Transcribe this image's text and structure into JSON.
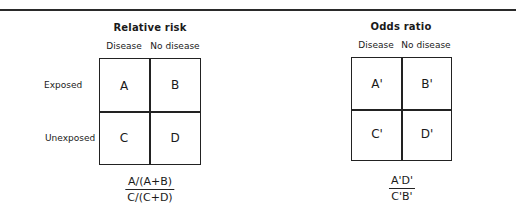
{
  "relative_risk": {
    "title": "Relative risk",
    "columns": [
      "Disease",
      "No disease"
    ],
    "rows": [
      "Exposed",
      "Unexposed"
    ],
    "cells": [
      "A",
      "B",
      "C",
      "D"
    ],
    "formula": {
      "numerator": "A/(A+B)",
      "denominator": "C/(C+D)"
    }
  },
  "odds_ratio": {
    "title": "Odds ratio",
    "columns": [
      "Disease",
      "No disease"
    ],
    "cells": [
      "A'",
      "B'",
      "C'",
      "D'"
    ],
    "formula": {
      "numerator": "A'D'",
      "denominator": "C'B'"
    }
  }
}
